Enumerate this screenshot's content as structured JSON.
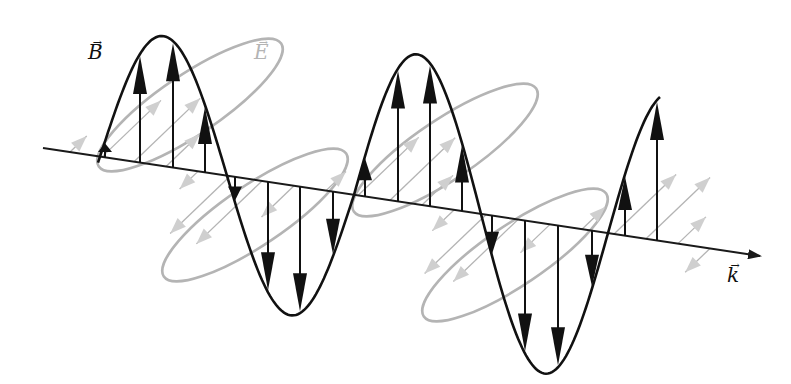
{
  "labels": {
    "magnetic": "B",
    "electric": "E",
    "propagation": "k",
    "vector_mark": "→"
  },
  "colors": {
    "magnetic": "#111111",
    "electric": "#b4b4b4",
    "axis": "#1a1a1a",
    "background": "#ffffff"
  },
  "axis": {
    "x1": 43,
    "y1": 148,
    "x2": 760,
    "y2": 256
  },
  "magnetic_wave": {
    "x_start": 98,
    "x_end": 660,
    "zero_x": 100,
    "half_period": 127,
    "amplitude_top": [
      130,
      130,
      150,
      150,
      150
    ],
    "arrows_x": [
      105,
      140,
      173,
      205,
      235,
      268,
      300,
      333,
      365,
      398,
      430,
      462,
      492,
      525,
      558,
      592,
      625,
      657
    ]
  },
  "electric_wave": {
    "note": "slanted loops in gray, inclined toward upper-right",
    "loops": [
      {
        "cx": 190,
        "cy": 105,
        "rx": 110,
        "ry": 30,
        "rot": -34,
        "side": "up"
      },
      {
        "cx": 255,
        "cy": 215,
        "rx": 110,
        "ry": 30,
        "rot": -34,
        "side": "down"
      },
      {
        "cx": 445,
        "cy": 150,
        "rx": 110,
        "ry": 30,
        "rot": -34,
        "side": "up"
      },
      {
        "cx": 515,
        "cy": 255,
        "rx": 110,
        "ry": 30,
        "rot": -34,
        "side": "down"
      }
    ]
  },
  "label_positions": {
    "B": {
      "x": 88,
      "y": 42
    },
    "E": {
      "x": 256,
      "y": 42
    },
    "k": {
      "x": 727,
      "y": 265
    }
  }
}
